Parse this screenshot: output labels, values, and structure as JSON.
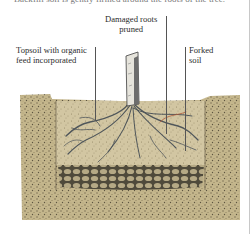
{
  "caption_top": "Backfill soil is gently firmed around the roots of the tree.",
  "labels": {
    "damaged_roots": [
      "Damaged roots",
      "pruned"
    ],
    "topsoil": [
      "Topsoil with organic",
      "feed incorporated"
    ],
    "forked_soil": [
      "Forked",
      "soil"
    ]
  },
  "colors": {
    "soil": "#c2b48a",
    "soil_dark": "#8a7d5c",
    "topsoil_fill": "#cbbf99",
    "rock_layer": "#7d735a",
    "trunk": "#e8e6df",
    "root": "#5a5f62",
    "leader_line": "#555555"
  }
}
